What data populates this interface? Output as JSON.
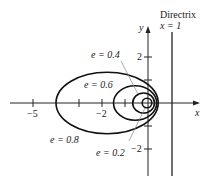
{
  "diagram": {
    "type": "conic-family",
    "directrix": {
      "title": "Directrix",
      "equation": "x = 1",
      "x": 1
    },
    "axes": {
      "x_label": "x",
      "y_label": "y",
      "x_ticks": [
        {
          "value": -5,
          "label": "−5"
        },
        {
          "value": -4,
          "label": ""
        },
        {
          "value": -2,
          "label": "−2"
        },
        {
          "value": -1,
          "label": ""
        }
      ],
      "y_ticks": [
        {
          "value": 2,
          "label": "2"
        },
        {
          "value": 1,
          "label": ""
        },
        {
          "value": -1,
          "label": ""
        },
        {
          "value": -2,
          "label": "−2"
        }
      ]
    },
    "curves": [
      {
        "e": 0.8,
        "label": "e = 0.8"
      },
      {
        "e": 0.6,
        "label": "e = 0.6"
      },
      {
        "e": 0.4,
        "label": "e = 0.4"
      },
      {
        "e": 0.2,
        "label": "e = 0.2"
      }
    ],
    "colors": {
      "curve": "#111111",
      "axis": "#222222",
      "leader": "#888888"
    }
  }
}
